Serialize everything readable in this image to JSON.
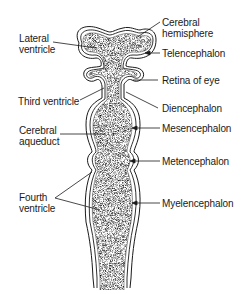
{
  "figure": {
    "colors": {
      "ink": "#1a1a1a",
      "fill": "#8a8a8a",
      "background": "#ffffff"
    }
  },
  "labels_left": [
    {
      "id": "lateral-ventricle",
      "lines": [
        "Lateral",
        "ventricle"
      ]
    },
    {
      "id": "third-ventricle",
      "lines": [
        "Third ventricle"
      ]
    },
    {
      "id": "cerebral-aqueduct",
      "lines": [
        "Cerebral",
        "aqueduct"
      ]
    },
    {
      "id": "fourth-ventricle",
      "lines": [
        "Fourth",
        "ventricle"
      ]
    }
  ],
  "labels_right": [
    {
      "id": "cerebral-hemisphere",
      "lines": [
        "Cerebral",
        "hemisphere"
      ]
    },
    {
      "id": "telencephalon",
      "lines": [
        "Telencephalon"
      ]
    },
    {
      "id": "retina-of-eye",
      "lines": [
        "Retina of eye"
      ]
    },
    {
      "id": "diencephalon",
      "lines": [
        "Diencephalon"
      ]
    },
    {
      "id": "mesencephalon",
      "lines": [
        "Mesencephalon"
      ]
    },
    {
      "id": "metencephalon",
      "lines": [
        "Metencephalon"
      ]
    },
    {
      "id": "myelencephalon",
      "lines": [
        "Myelencephalon"
      ]
    }
  ]
}
